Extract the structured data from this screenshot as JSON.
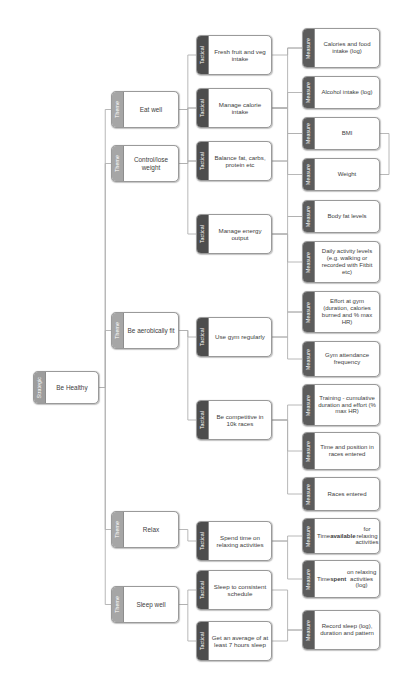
{
  "diagram": {
    "levels": {
      "strategic": "Strategic",
      "theme": "Theme",
      "tactical": "Tactical",
      "measure": "Measure"
    },
    "colors": {
      "strategic_band": "#9d9d9d",
      "theme_band": "#a6a6a6",
      "tactical_band": "#4d4d4d",
      "measure_band": "#5c5c5c",
      "node_border": "#9a9a9a",
      "node_fill": "#ffffff",
      "connector": "#b0b0b0",
      "text": "#404040",
      "band_text": "#ffffff",
      "background": "#ffffff"
    }
  },
  "nodes": {
    "strategic": [
      {
        "id": "be-healthy",
        "level": "Strategic",
        "label": "Be Healthy",
        "x": 33,
        "y": 371,
        "w": 66,
        "h": 33
      }
    ],
    "themes": [
      {
        "id": "eat-well",
        "level": "Theme",
        "label": "Eat well",
        "x": 111,
        "y": 91,
        "w": 68,
        "h": 37
      },
      {
        "id": "control-lose-weight",
        "level": "Theme",
        "label": "Control/lose weight",
        "x": 111,
        "y": 145,
        "w": 68,
        "h": 37
      },
      {
        "id": "be-aerobically-fit",
        "level": "Theme",
        "label": "Be aerobically fit",
        "x": 111,
        "y": 312,
        "w": 68,
        "h": 37
      },
      {
        "id": "relax",
        "level": "Theme",
        "label": "Relax",
        "x": 111,
        "y": 511,
        "w": 68,
        "h": 37
      },
      {
        "id": "sleep-well",
        "level": "Theme",
        "label": "Sleep well",
        "x": 111,
        "y": 586,
        "w": 68,
        "h": 37
      }
    ],
    "tacticals": [
      {
        "id": "fresh-fruit-and-veg-intake",
        "level": "Tactical",
        "label": "Fresh fruit and veg intake",
        "x": 196,
        "y": 35,
        "w": 76,
        "h": 40
      },
      {
        "id": "manage-calorie-intake",
        "level": "Tactical",
        "label": "Manage calorie intake",
        "x": 196,
        "y": 88,
        "w": 76,
        "h": 40
      },
      {
        "id": "balance-fat-carbs-protein-etc",
        "level": "Tactical",
        "label": "Balance fat, carbs, protein etc",
        "x": 196,
        "y": 141,
        "w": 76,
        "h": 40
      },
      {
        "id": "manage-energy-output",
        "level": "Tactical",
        "label": "Manage energy output",
        "x": 196,
        "y": 214,
        "w": 76,
        "h": 40
      },
      {
        "id": "use-gym-regularly",
        "level": "Tactical",
        "label": "Use gym regularly",
        "x": 196,
        "y": 317,
        "w": 76,
        "h": 40
      },
      {
        "id": "be-competitive-in-10k-races",
        "level": "Tactical",
        "label": "Be competitive in 10k races",
        "x": 196,
        "y": 400,
        "w": 76,
        "h": 40
      },
      {
        "id": "spend-time-on-relaxing-activities",
        "level": "Tactical",
        "label": "Spend time on relaxing activities",
        "x": 196,
        "y": 521,
        "w": 76,
        "h": 40
      },
      {
        "id": "sleep-to-consistent-schedule",
        "level": "Tactical",
        "label": "Sleep to consistent schedule",
        "x": 196,
        "y": 570,
        "w": 76,
        "h": 40
      },
      {
        "id": "get-an-average-of-at-least-7-hours-sleep",
        "level": "Tactical",
        "label": "Get an average of at least 7 hours sleep",
        "x": 196,
        "y": 621,
        "w": 76,
        "h": 40
      }
    ],
    "measures": [
      {
        "id": "calories-and-food-intake-log",
        "level": "Measure",
        "label": "Calories and food intake (log)",
        "x": 302,
        "y": 28,
        "w": 78,
        "h": 40
      },
      {
        "id": "alcohol-intake-log",
        "level": "Measure",
        "label": "Alcohol intake (log)",
        "x": 302,
        "y": 76,
        "w": 78,
        "h": 33
      },
      {
        "id": "bmi",
        "level": "Measure",
        "label": "BMI",
        "x": 302,
        "y": 117,
        "w": 78,
        "h": 33
      },
      {
        "id": "weight",
        "level": "Measure",
        "label": "Weight",
        "x": 302,
        "y": 158,
        "w": 78,
        "h": 33
      },
      {
        "id": "body-fat-levels",
        "level": "Measure",
        "label": "Body fat levels",
        "x": 302,
        "y": 200,
        "w": 78,
        "h": 33
      },
      {
        "id": "daily-activity-levels",
        "level": "Measure",
        "label": "Daily activity levels (e.g. walking or recorded with Fitbit etc)",
        "x": 302,
        "y": 241,
        "w": 78,
        "h": 42
      },
      {
        "id": "effort-at-gym",
        "level": "Measure",
        "label": "Effort at gym (duration, calories burned and % max HR)",
        "x": 302,
        "y": 291,
        "w": 78,
        "h": 42
      },
      {
        "id": "gym-attendance-frequency",
        "level": "Measure",
        "label": "Gym attendance frequency",
        "x": 302,
        "y": 341,
        "w": 78,
        "h": 36
      },
      {
        "id": "training-cumulative-duration-and-effort",
        "level": "Measure",
        "label": "Training - cumulative duration and effort (% max HR)",
        "x": 302,
        "y": 384,
        "w": 78,
        "h": 42
      },
      {
        "id": "time-and-position-in-races-entered",
        "level": "Measure",
        "label": "Time and position in races entered",
        "x": 302,
        "y": 432,
        "w": 78,
        "h": 38
      },
      {
        "id": "races-entered",
        "level": "Measure",
        "label": "Races entered",
        "x": 302,
        "y": 477,
        "w": 78,
        "h": 34
      },
      {
        "id": "time-available-for-relaxing-activities",
        "level": "Measure",
        "label": "Time available for relaxing activities",
        "x": 302,
        "y": 518,
        "w": 78,
        "h": 36,
        "bold_word": "available"
      },
      {
        "id": "time-spent-on-relaxing-activities-log",
        "level": "Measure",
        "label": "Time spent on relaxing activities (log)",
        "x": 302,
        "y": 560,
        "w": 78,
        "h": 38,
        "bold_word": "spent"
      },
      {
        "id": "record-sleep-log-duration-and-pattern",
        "level": "Measure",
        "label": "Record sleep (log), duration and pattern",
        "x": 302,
        "y": 610,
        "w": 78,
        "h": 40
      }
    ]
  },
  "connections": [
    {
      "from": "be-healthy",
      "to": "eat-well"
    },
    {
      "from": "be-healthy",
      "to": "control-lose-weight"
    },
    {
      "from": "be-healthy",
      "to": "be-aerobically-fit"
    },
    {
      "from": "be-healthy",
      "to": "relax"
    },
    {
      "from": "be-healthy",
      "to": "sleep-well"
    },
    {
      "from": "eat-well",
      "to": "fresh-fruit-and-veg-intake"
    },
    {
      "from": "eat-well",
      "to": "manage-calorie-intake"
    },
    {
      "from": "eat-well",
      "to": "balance-fat-carbs-protein-etc"
    },
    {
      "from": "control-lose-weight",
      "to": "manage-calorie-intake"
    },
    {
      "from": "control-lose-weight",
      "to": "balance-fat-carbs-protein-etc"
    },
    {
      "from": "control-lose-weight",
      "to": "manage-energy-output"
    },
    {
      "from": "be-aerobically-fit",
      "to": "use-gym-regularly"
    },
    {
      "from": "be-aerobically-fit",
      "to": "be-competitive-in-10k-races"
    },
    {
      "from": "relax",
      "to": "spend-time-on-relaxing-activities"
    },
    {
      "from": "sleep-well",
      "to": "sleep-to-consistent-schedule"
    },
    {
      "from": "sleep-well",
      "to": "get-an-average-of-at-least-7-hours-sleep"
    },
    {
      "from": "fresh-fruit-and-veg-intake",
      "to": "calories-and-food-intake-log"
    },
    {
      "from": "manage-calorie-intake",
      "to": "calories-and-food-intake-log"
    },
    {
      "from": "manage-calorie-intake",
      "to": "alcohol-intake-log"
    },
    {
      "from": "manage-calorie-intake",
      "to": "bmi"
    },
    {
      "from": "manage-calorie-intake",
      "to": "weight"
    },
    {
      "from": "balance-fat-carbs-protein-etc",
      "to": "bmi"
    },
    {
      "from": "balance-fat-carbs-protein-etc",
      "to": "body-fat-levels"
    },
    {
      "from": "manage-energy-output",
      "to": "body-fat-levels"
    },
    {
      "from": "manage-energy-output",
      "to": "daily-activity-levels"
    },
    {
      "from": "manage-energy-output",
      "to": "effort-at-gym"
    },
    {
      "from": "use-gym-regularly",
      "to": "effort-at-gym"
    },
    {
      "from": "use-gym-regularly",
      "to": "gym-attendance-frequency"
    },
    {
      "from": "be-competitive-in-10k-races",
      "to": "training-cumulative-duration-and-effort"
    },
    {
      "from": "be-competitive-in-10k-races",
      "to": "time-and-position-in-races-entered"
    },
    {
      "from": "be-competitive-in-10k-races",
      "to": "races-entered"
    },
    {
      "from": "spend-time-on-relaxing-activities",
      "to": "time-available-for-relaxing-activities"
    },
    {
      "from": "spend-time-on-relaxing-activities",
      "to": "time-spent-on-relaxing-activities-log"
    },
    {
      "from": "sleep-to-consistent-schedule",
      "to": "record-sleep-log-duration-and-pattern"
    },
    {
      "from": "get-an-average-of-at-least-7-hours-sleep",
      "to": "record-sleep-log-duration-and-pattern"
    },
    {
      "from": "bmi",
      "to": "weight"
    }
  ]
}
